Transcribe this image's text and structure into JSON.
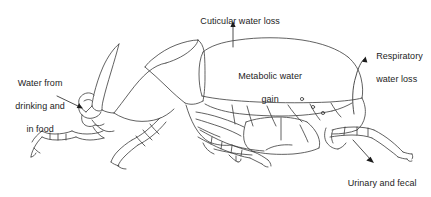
{
  "figure": {
    "kind": "line-drawing-diagram",
    "line_color": "#3a3a3a",
    "text_color": "#1c1c1c",
    "background_color": "#ffffff",
    "width": 431,
    "height": 197
  },
  "labels": {
    "cuticular": {
      "line1": "Cuticular water loss",
      "arrow": "arrow-up"
    },
    "metabolic": {
      "line1": "Metabolic water",
      "line2": "gain",
      "arrow": "none"
    },
    "respiratory": {
      "line1": "Respiratory",
      "line2": "water loss",
      "arrow": "curved-arrow-up-right"
    },
    "water_intake": {
      "line1": "Water from",
      "line2": "drinking and",
      "line3": "in food",
      "arrow": "arrow-right-down"
    },
    "urinary": {
      "line1": "Urinary and fecal",
      "line2": "water loss",
      "arrow": "arrow-down-right"
    }
  }
}
